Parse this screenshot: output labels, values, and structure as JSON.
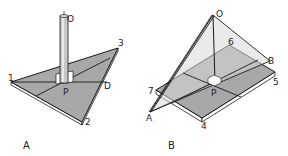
{
  "colors": {
    "plate": "#a8a8a8",
    "plate_light": "#d4d4d4",
    "edge": "#1a1a1a",
    "background": "#ffffff"
  },
  "panels": [
    {
      "id": "A",
      "label": "A",
      "points": {
        "O": "O",
        "P": "P",
        "D": "D",
        "v1": "1",
        "v2": "2",
        "v3": "3"
      }
    },
    {
      "id": "B",
      "label": "B",
      "points": {
        "O": "O",
        "P": "P",
        "A": "A",
        "B": "B",
        "c4": "4",
        "c5": "5",
        "c6": "6",
        "c7": "7"
      }
    }
  ]
}
